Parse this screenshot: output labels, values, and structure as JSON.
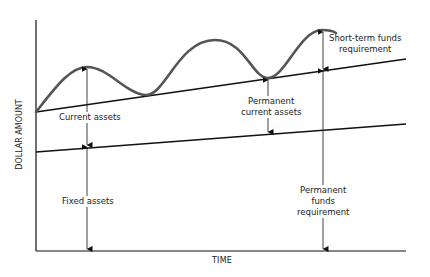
{
  "diagram": {
    "axes": {
      "x_label": "TIME",
      "y_label": "DOLLAR AMOUNT"
    },
    "labels": {
      "current_assets": "Current assets",
      "fixed_assets": "Fixed assets",
      "permanent_current_assets_line1": "Permanent",
      "permanent_current_assets_line2": "current assets",
      "short_term_line1": "Short-term funds",
      "short_term_line2": "requirement",
      "permanent_funds_line1": "Permanent",
      "permanent_funds_line2": "funds",
      "permanent_funds_line3": "requirement"
    },
    "series": [
      {
        "name": "Fixed assets level",
        "type": "rising straight line"
      },
      {
        "name": "Permanent current assets level",
        "type": "rising straight line"
      },
      {
        "name": "Total assets (with seasonal fluctuation)",
        "type": "wave above permanent level"
      }
    ],
    "colors": {
      "line": "#111111",
      "curve": "#555555",
      "text": "#222222"
    }
  }
}
